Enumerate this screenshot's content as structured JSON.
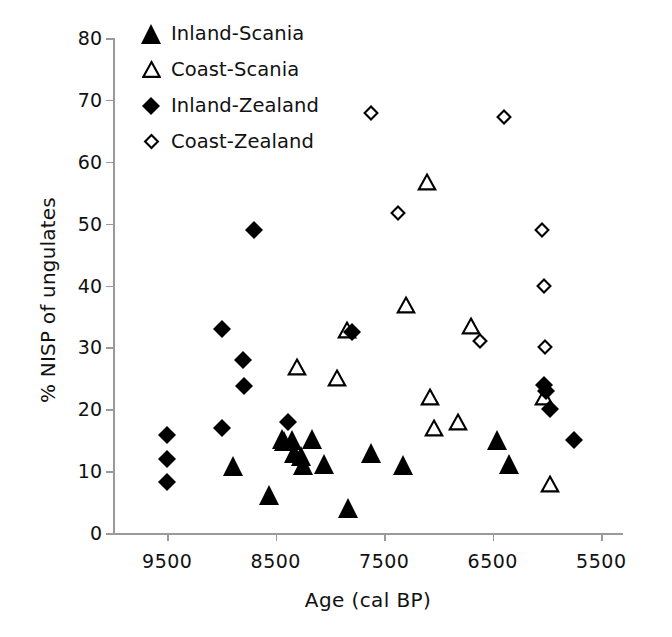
{
  "chart_data": {
    "type": "scatter",
    "title": "",
    "xlabel": "Age  (cal BP)",
    "ylabel": "% NISP of ungulates",
    "xlim": [
      10000,
      5300
    ],
    "ylim": [
      0,
      80
    ],
    "x_reversed": true,
    "xticks": [
      9500,
      8500,
      7500,
      6500,
      5500
    ],
    "xticklabels": [
      "9500",
      "8500",
      "7500",
      "6500",
      "5500"
    ],
    "yticks": [
      0,
      10,
      20,
      30,
      40,
      50,
      60,
      70,
      80
    ],
    "yticklabels": [
      "0",
      "10",
      "20",
      "30",
      "40",
      "50",
      "60",
      "70",
      "80"
    ],
    "grid": false,
    "legend_position": "upper-left-inside",
    "series": [
      {
        "name": "Inland-Scania",
        "marker": "filled-triangle",
        "color": "#000000",
        "points": [
          {
            "x": 8890,
            "y": 10.8
          },
          {
            "x": 8560,
            "y": 6.2
          },
          {
            "x": 8440,
            "y": 15.2
          },
          {
            "x": 8420,
            "y": 14.8
          },
          {
            "x": 8350,
            "y": 15.0
          },
          {
            "x": 8330,
            "y": 13.0
          },
          {
            "x": 8270,
            "y": 12.5
          },
          {
            "x": 8250,
            "y": 11.0
          },
          {
            "x": 8170,
            "y": 15.2
          },
          {
            "x": 8060,
            "y": 11.2
          },
          {
            "x": 7830,
            "y": 4.0
          },
          {
            "x": 7620,
            "y": 13.0
          },
          {
            "x": 7330,
            "y": 11.0
          },
          {
            "x": 6460,
            "y": 15.0
          },
          {
            "x": 6350,
            "y": 11.2
          }
        ]
      },
      {
        "name": "Coast-Scania",
        "marker": "open-triangle",
        "color": "#000000",
        "points": [
          {
            "x": 8300,
            "y": 26.8
          },
          {
            "x": 7940,
            "y": 25.0
          },
          {
            "x": 7840,
            "y": 32.8
          },
          {
            "x": 7300,
            "y": 36.9
          },
          {
            "x": 7110,
            "y": 56.7
          },
          {
            "x": 7080,
            "y": 22.0
          },
          {
            "x": 7040,
            "y": 17.0
          },
          {
            "x": 6820,
            "y": 18.0
          },
          {
            "x": 6700,
            "y": 33.5
          },
          {
            "x": 6030,
            "y": 22.0
          },
          {
            "x": 5970,
            "y": 8.0
          }
        ]
      },
      {
        "name": "Inland-Zealand",
        "marker": "filled-diamond",
        "color": "#000000",
        "points": [
          {
            "x": 9500,
            "y": 15.8
          },
          {
            "x": 9500,
            "y": 12.0
          },
          {
            "x": 9500,
            "y": 8.3
          },
          {
            "x": 9000,
            "y": 33.0
          },
          {
            "x": 9000,
            "y": 17.0
          },
          {
            "x": 8800,
            "y": 28.0
          },
          {
            "x": 8790,
            "y": 23.7
          },
          {
            "x": 8700,
            "y": 49.0
          },
          {
            "x": 8390,
            "y": 18.0
          },
          {
            "x": 7800,
            "y": 32.5
          },
          {
            "x": 6030,
            "y": 24.0
          },
          {
            "x": 6010,
            "y": 23.0
          },
          {
            "x": 5970,
            "y": 20.0
          },
          {
            "x": 5750,
            "y": 15.0
          }
        ]
      },
      {
        "name": "Coast-Zealand",
        "marker": "open-diamond",
        "color": "#000000",
        "points": [
          {
            "x": 7620,
            "y": 67.8
          },
          {
            "x": 7370,
            "y": 51.7
          },
          {
            "x": 6620,
            "y": 31.0
          },
          {
            "x": 6400,
            "y": 67.3
          },
          {
            "x": 6050,
            "y": 49.0
          },
          {
            "x": 6030,
            "y": 40.0
          },
          {
            "x": 6020,
            "y": 30.0
          }
        ]
      }
    ]
  },
  "legend": {
    "items": [
      {
        "label": "Inland-Scania",
        "marker": "filled-triangle"
      },
      {
        "label": "Coast-Scania",
        "marker": "open-triangle"
      },
      {
        "label": "Inland-Zealand",
        "marker": "filled-diamond"
      },
      {
        "label": "Coast-Zealand",
        "marker": "open-diamond"
      }
    ]
  }
}
